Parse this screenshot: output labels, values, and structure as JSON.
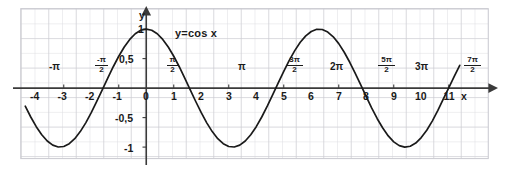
{
  "figure": {
    "curve_label": "y=cos x",
    "x_axis_name": "x",
    "y_axis_name": "y",
    "background_color": "#ffffff",
    "grid_color": "#d9d9de",
    "grid_major_color": "#c6c6cd",
    "axis_color": "#3a3a3a",
    "curve_color": "#1a1a1a"
  },
  "chart_data": {
    "type": "line",
    "title": "",
    "subtitle": "",
    "xlabel": "x",
    "ylabel": "y",
    "function": "y = cos x",
    "xlim": [
      -4.4,
      11.4
    ],
    "ylim": [
      -1.35,
      1.35
    ],
    "grid": true,
    "grid_step_x": 0.5,
    "grid_step_y": 0.25,
    "legend_position": "inline-near-curve",
    "annotations": [
      {
        "text": "y=cos x",
        "x": 1.1,
        "y": 0.88
      }
    ],
    "x_tick_labels": [
      "-4",
      "-3",
      "-2",
      "-1",
      "0",
      "1",
      "2",
      "3",
      "4",
      "5",
      "6",
      "7",
      "8",
      "9",
      "10",
      "11"
    ],
    "x_tick_values": [
      -4,
      -3,
      -2,
      -1,
      0,
      1,
      2,
      3,
      4,
      5,
      6,
      7,
      8,
      9,
      10,
      11
    ],
    "y_tick_labels": [
      "1",
      "0,5",
      "-0,5",
      "-1"
    ],
    "y_tick_values": [
      1,
      0.5,
      -0.5,
      -1
    ],
    "pi_tick_labels": [
      {
        "text": "-π",
        "kind": "plain",
        "value": -3.14159
      },
      {
        "num": "-π",
        "den": "2",
        "kind": "fraction",
        "value": -1.5708
      },
      {
        "num": "π",
        "den": "2",
        "kind": "fraction",
        "value": 1.5708
      },
      {
        "text": "π",
        "kind": "plain",
        "value": 3.14159
      },
      {
        "num": "3π",
        "den": "2",
        "kind": "fraction",
        "value": 4.71239
      },
      {
        "text": "2π",
        "kind": "plain",
        "value": 6.28319
      },
      {
        "num": "5π",
        "den": "2",
        "kind": "fraction",
        "value": 7.85398
      },
      {
        "text": "3π",
        "kind": "plain",
        "value": 9.42478
      },
      {
        "num": "7π",
        "den": "2",
        "kind": "fraction",
        "value": 10.99557
      }
    ],
    "series": [
      {
        "name": "y = cos x",
        "x": [
          -4.4,
          -4.2,
          -4.0,
          -3.8,
          -3.6,
          -3.4,
          -3.2,
          -3.0,
          -2.8,
          -2.6,
          -2.4,
          -2.2,
          -2.0,
          -1.8,
          -1.6,
          -1.4,
          -1.2,
          -1.0,
          -0.8,
          -0.6,
          -0.4,
          -0.2,
          0.0,
          0.2,
          0.4,
          0.6,
          0.8,
          1.0,
          1.2,
          1.4,
          1.6,
          1.8,
          2.0,
          2.2,
          2.4,
          2.6,
          2.8,
          3.0,
          3.2,
          3.4,
          3.6,
          3.8,
          4.0,
          4.2,
          4.4,
          4.6,
          4.8,
          5.0,
          5.2,
          5.4,
          5.6,
          5.8,
          6.0,
          6.2,
          6.4,
          6.6,
          6.8,
          7.0,
          7.2,
          7.4,
          7.6,
          7.8,
          8.0,
          8.2,
          8.4,
          8.6,
          8.8,
          9.0,
          9.2,
          9.4,
          9.6,
          9.8,
          10.0,
          10.2,
          10.4,
          10.6,
          10.8,
          11.0,
          11.2,
          11.4
        ],
        "y": [
          -0.307,
          -0.49,
          -0.654,
          -0.79,
          -0.897,
          -0.967,
          -0.998,
          -0.99,
          -0.942,
          -0.857,
          -0.737,
          -0.589,
          -0.416,
          -0.227,
          -0.029,
          0.17,
          0.362,
          0.54,
          0.697,
          0.825,
          0.921,
          0.98,
          1.0,
          0.98,
          0.921,
          0.825,
          0.697,
          0.54,
          0.362,
          0.17,
          -0.029,
          -0.227,
          -0.416,
          -0.589,
          -0.737,
          -0.857,
          -0.942,
          -0.99,
          -0.998,
          -0.967,
          -0.897,
          -0.79,
          -0.654,
          -0.49,
          -0.307,
          -0.112,
          0.087,
          0.284,
          0.469,
          0.635,
          0.776,
          0.886,
          0.96,
          0.997,
          0.993,
          0.95,
          0.869,
          0.754,
          0.608,
          0.438,
          0.251,
          0.053,
          -0.146,
          -0.34,
          -0.519,
          -0.677,
          -0.811,
          -0.911,
          -0.975,
          -1.0,
          -0.985,
          -0.931,
          -0.839,
          -0.714,
          -0.559,
          -0.381,
          -0.187,
          0.004,
          0.199,
          0.387
        ]
      }
    ]
  },
  "ticks": {
    "x": [
      {
        "label": "-4",
        "value": -4
      },
      {
        "label": "-3",
        "value": -3
      },
      {
        "label": "-2",
        "value": -2
      },
      {
        "label": "-1",
        "value": -1
      },
      {
        "label": "0",
        "value": 0
      },
      {
        "label": "1",
        "value": 1
      },
      {
        "label": "2",
        "value": 2
      },
      {
        "label": "3",
        "value": 3
      },
      {
        "label": "4",
        "value": 4
      },
      {
        "label": "5",
        "value": 5
      },
      {
        "label": "6",
        "value": 6
      },
      {
        "label": "7",
        "value": 7
      },
      {
        "label": "8",
        "value": 8
      },
      {
        "label": "9",
        "value": 9
      },
      {
        "label": "10",
        "value": 10
      },
      {
        "label": "11",
        "value": 11
      }
    ],
    "y": [
      {
        "label": "1",
        "value": 1
      },
      {
        "label": "0,5",
        "value": 0.5
      },
      {
        "label": "-0,5",
        "value": -0.5
      },
      {
        "label": "-1",
        "value": -1
      }
    ]
  },
  "pi_labels": {
    "minus_pi": "-π",
    "minus_pi_half_num": "-π",
    "minus_pi_half_den": "2",
    "pi_half_num": "π",
    "pi_half_den": "2",
    "pi": "π",
    "three_pi_half_num": "3π",
    "three_pi_half_den": "2",
    "two_pi": "2π",
    "five_pi_half_num": "5π",
    "five_pi_half_den": "2",
    "three_pi": "3π",
    "seven_pi_half_num": "7π",
    "seven_pi_half_den": "2"
  }
}
